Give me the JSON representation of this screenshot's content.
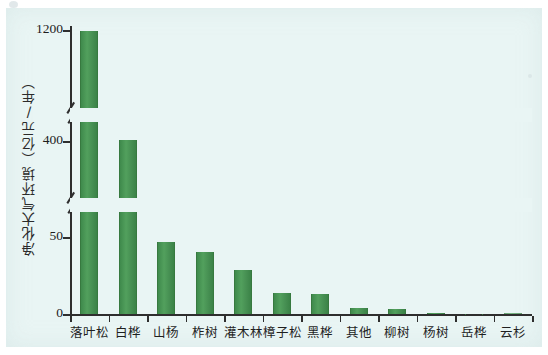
{
  "chart_data": {
    "type": "bar",
    "title": "",
    "subtitle": "",
    "xlabel": "",
    "ylabel": "净化大气环境（亿元/年）",
    "categories": [
      "落叶松",
      "白桦",
      "山杨",
      "柞树",
      "灌木林",
      "樟子松",
      "黑桦",
      "其他",
      "柳树",
      "杨树",
      "岳桦",
      "云杉"
    ],
    "values": [
      1195,
      410,
      47,
      40,
      29,
      14,
      13,
      4,
      3.5,
      1,
      0.4,
      0.2
    ],
    "value_unit": "亿元/年",
    "grid": false,
    "legend": false,
    "legend_position": "none",
    "broken_axis": true,
    "axis_breaks": [
      {
        "after_value": 50,
        "label_above": "400"
      },
      {
        "after_value": 400,
        "label_above": "1200"
      }
    ],
    "ytick_labels": [
      "0",
      "50",
      "400",
      "1200"
    ],
    "ytick_values": [
      0,
      50,
      400,
      1200
    ],
    "ylim": [
      0,
      1200
    ],
    "bar_color": "#4a9456",
    "background_color": "#e9f5f4",
    "axis_color": "#2e2e2e",
    "n_categories": 12
  },
  "figure": {
    "background": "#ffffff",
    "plot_background": "#e9f5f4"
  }
}
